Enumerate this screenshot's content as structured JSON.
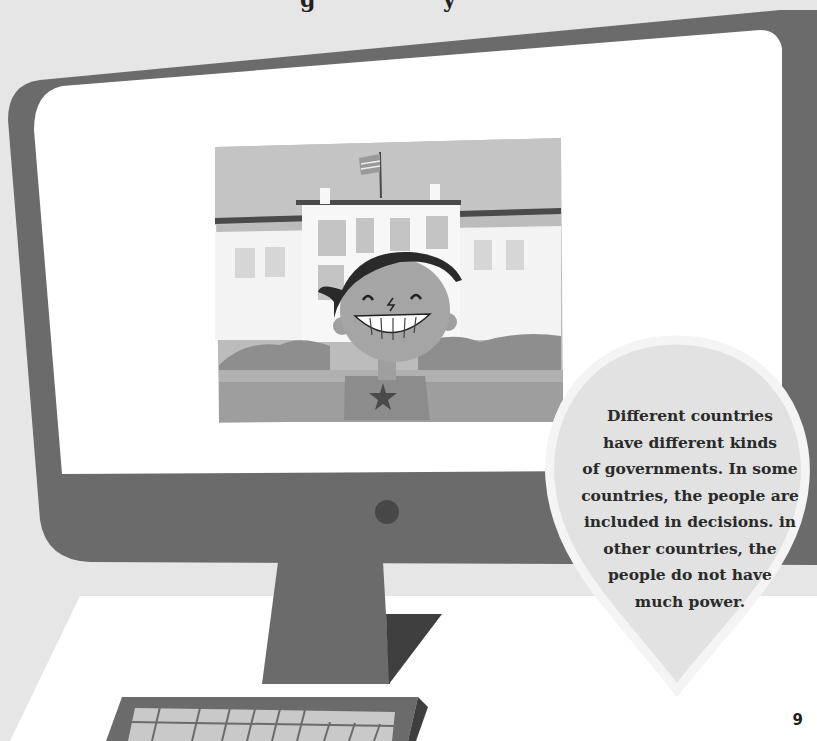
{
  "page": {
    "title_fragment": "g y",
    "page_number": "9"
  },
  "callout": {
    "lines": [
      "Different countries",
      "have different kinds",
      "of governments. In some",
      "countries, the people are",
      "included in decisions. in",
      "other countries, the",
      "people do not have",
      "much power."
    ]
  },
  "illustration": {
    "subject": "computer monitor showing a smiling boy in front of a government building with a flag",
    "icons": [
      "monitor-icon",
      "flag-icon",
      "star-icon",
      "keyboard-icon",
      "power-button-icon"
    ]
  },
  "colors": {
    "background": "#e6e6e6",
    "monitor_frame": "#6b6b6b",
    "screen": "#ffffff",
    "callout_fill": "#e2e2e2",
    "callout_border": "#f2f2f2",
    "text": "#2a2a2a"
  }
}
